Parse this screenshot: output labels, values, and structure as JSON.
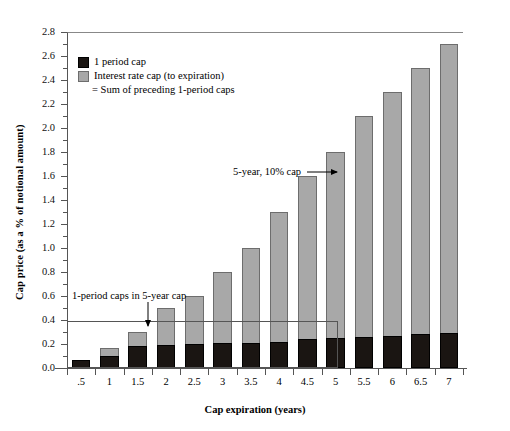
{
  "chart_data": {
    "type": "bar",
    "title": "",
    "xlabel": "Cap expiration (years)",
    "ylabel": "Cap price (as a % of notional amount)",
    "categories": [
      ".5",
      "1",
      "1.5",
      "2",
      "2.5",
      "3",
      "3.5",
      "4",
      "4.5",
      "5",
      "5.5",
      "6",
      "6.5",
      "7"
    ],
    "ylim": [
      0.0,
      2.8
    ],
    "ytick_labels": [
      "0.0",
      "0.2",
      "0.4",
      "0.6",
      "0.8",
      "1.0",
      "1.2",
      "1.4",
      "1.6",
      "1.8",
      "2.0",
      "2.2",
      "2.4",
      "2.6",
      "2.8"
    ],
    "ytick_values": [
      0.0,
      0.2,
      0.4,
      0.6,
      0.8,
      1.0,
      1.2,
      1.4,
      1.6,
      1.8,
      2.0,
      2.2,
      2.4,
      2.6,
      2.8
    ],
    "grid": false,
    "stacked": true,
    "legend_position": "upper-left",
    "series": [
      {
        "name": "1 period cap",
        "color": "#1a1512",
        "values": [
          0.07,
          0.1,
          0.18,
          0.19,
          0.2,
          0.21,
          0.21,
          0.22,
          0.24,
          0.25,
          0.26,
          0.27,
          0.28,
          0.29
        ]
      },
      {
        "name": "Interest rate cap (to expiration) = Sum of preceding 1-period caps",
        "color": "#a8a8a8",
        "values": [
          0.0,
          0.07,
          0.12,
          0.31,
          0.4,
          0.59,
          0.79,
          1.08,
          1.36,
          1.55,
          1.84,
          2.03,
          2.22,
          2.41
        ]
      }
    ],
    "totals": [
      0.07,
      0.17,
      0.3,
      0.5,
      0.6,
      0.8,
      1.0,
      1.3,
      1.6,
      1.8,
      2.1,
      2.3,
      2.5,
      2.7
    ],
    "annotations": [
      {
        "text": "5-year, 10% cap",
        "target_category": "5",
        "direction": "right"
      },
      {
        "text": "1-period caps in 5-year cap",
        "target_category": "1.5",
        "direction": "down"
      }
    ]
  },
  "legend": {
    "item1_label": "1 period cap",
    "item2_label": "Interest rate cap (to expiration)",
    "item2_sub": "= Sum of preceding 1-period caps"
  },
  "annotations": {
    "five_year": "5-year, 10% cap",
    "one_period": "1-period caps in 5-year cap"
  },
  "axes": {
    "y_title": "Cap price (as a % of notional amount)",
    "x_title": "Cap expiration (years)"
  }
}
